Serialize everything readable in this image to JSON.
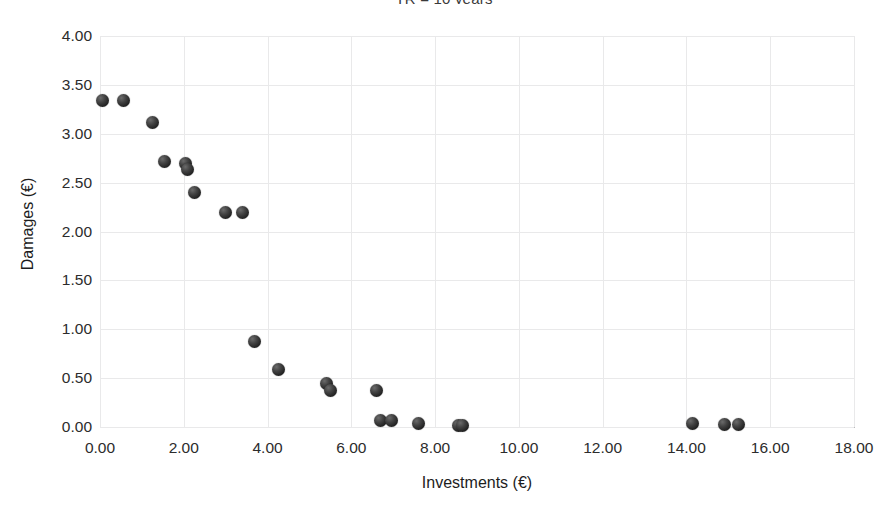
{
  "chart_data": {
    "type": "scatter",
    "title": "TR = 10 years",
    "xlabel": "Investments (€)",
    "ylabel": "Damages (€)",
    "xlim": [
      0,
      18
    ],
    "ylim": [
      0,
      4
    ],
    "xticks": [
      "0.00",
      "2.00",
      "4.00",
      "6.00",
      "8.00",
      "10.00",
      "12.00",
      "14.00",
      "16.00",
      "18.00"
    ],
    "xtick_values": [
      0,
      2,
      4,
      6,
      8,
      10,
      12,
      14,
      16,
      18
    ],
    "yticks": [
      "0.00",
      "0.50",
      "1.00",
      "1.50",
      "2.00",
      "2.50",
      "3.00",
      "3.50",
      "4.00"
    ],
    "ytick_values": [
      0,
      0.5,
      1.0,
      1.5,
      2.0,
      2.5,
      3.0,
      3.5,
      4.0
    ],
    "grid": true,
    "legend": null,
    "legend_position": "none",
    "marker_color": "#2b2b2b",
    "grid_color": "#e9e9ea",
    "axis_color": "#b9b9bb",
    "series": [
      {
        "name": "Investments vs Damages",
        "x": [
          0.05,
          0.55,
          1.25,
          1.55,
          2.05,
          2.1,
          2.25,
          3.0,
          3.4,
          3.7,
          4.25,
          5.4,
          5.5,
          6.6,
          6.7,
          6.95,
          7.6,
          8.55,
          8.65,
          14.15,
          14.9,
          15.25
        ],
        "y": [
          3.34,
          3.34,
          3.12,
          2.72,
          2.7,
          2.63,
          2.4,
          2.19,
          2.19,
          0.87,
          0.59,
          0.44,
          0.37,
          0.37,
          0.07,
          0.07,
          0.04,
          0.02,
          0.02,
          0.04,
          0.03,
          0.03
        ]
      }
    ]
  }
}
